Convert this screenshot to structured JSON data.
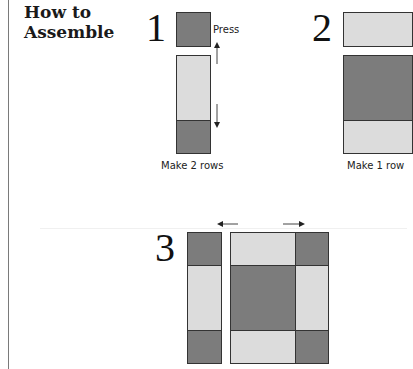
{
  "section": {
    "title_line1": "How to",
    "title_line2": "Assemble"
  },
  "steps": [
    {
      "number": "1",
      "press_label": "Press",
      "caption": "Make 2 rows"
    },
    {
      "number": "2",
      "caption": "Make 1 row"
    },
    {
      "number": "3"
    }
  ],
  "colors": {
    "dark_fabric": "#7c7c7c",
    "light_fabric": "#dcdcdc",
    "outline": "#333333"
  }
}
